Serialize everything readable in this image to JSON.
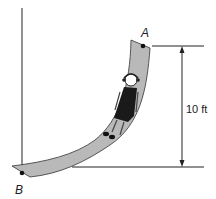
{
  "diagram": {
    "type": "physics-slide",
    "points": {
      "A": {
        "label": "A"
      },
      "B": {
        "label": "B"
      }
    },
    "dimension": {
      "label": "10 ft"
    },
    "colors": {
      "slide_fill": "#b9b9b9",
      "line": "#222222",
      "background": "#ffffff"
    }
  }
}
